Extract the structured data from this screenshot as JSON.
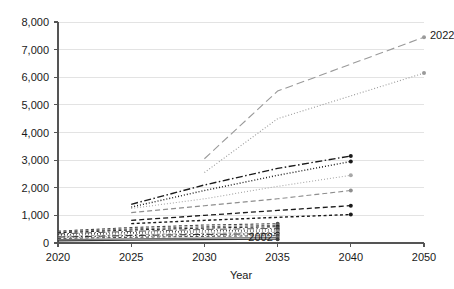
{
  "chart_data": {
    "type": "line",
    "title": "",
    "xlabel": "Year",
    "ylabel": "",
    "grid": true,
    "legend": "none",
    "x": [
      2020,
      2025,
      2030,
      2035,
      2040,
      2050
    ],
    "xtick_labels": [
      "2020",
      "2025",
      "2030",
      "2035",
      "2040",
      "2050"
    ],
    "ytick_labels": [
      "0",
      "1,000",
      "2,000",
      "3,000",
      "4,000",
      "5,000",
      "6,000",
      "7,000",
      "8,000"
    ],
    "ytick_values": [
      0,
      1000,
      2000,
      3000,
      4000,
      5000,
      6000,
      7000,
      8000
    ],
    "ylim": [
      0,
      8000
    ],
    "annotations": [
      {
        "text": "2022",
        "x": 2050,
        "y": 7450
      },
      {
        "text": "2002",
        "x": 2033,
        "y": 150
      }
    ],
    "series": [
      {
        "name": "s01",
        "style": "dash-long",
        "color": "#9a9a9a",
        "width": 1.1,
        "points": [
          {
            "x": 2030,
            "y": 3050
          },
          {
            "x": 2035,
            "y": 5500
          },
          {
            "x": 2050,
            "y": 7450
          }
        ]
      },
      {
        "name": "s02",
        "style": "dot",
        "color": "#9a9a9a",
        "width": 1.1,
        "points": [
          {
            "x": 2030,
            "y": 2550
          },
          {
            "x": 2035,
            "y": 4500
          },
          {
            "x": 2050,
            "y": 6150
          }
        ]
      },
      {
        "name": "s03",
        "style": "dash-dot",
        "color": "#1a1a1a",
        "width": 1.4,
        "points": [
          {
            "x": 2025,
            "y": 1400
          },
          {
            "x": 2030,
            "y": 2100
          },
          {
            "x": 2035,
            "y": 2700
          },
          {
            "x": 2040,
            "y": 3150
          }
        ]
      },
      {
        "name": "s04",
        "style": "dot",
        "color": "#1a1a1a",
        "width": 1.4,
        "points": [
          {
            "x": 2025,
            "y": 1300
          },
          {
            "x": 2030,
            "y": 1900
          },
          {
            "x": 2035,
            "y": 2450
          },
          {
            "x": 2040,
            "y": 2950
          }
        ]
      },
      {
        "name": "s05",
        "style": "dot",
        "color": "#a8a8a8",
        "width": 1.1,
        "points": [
          {
            "x": 2025,
            "y": 1250
          },
          {
            "x": 2030,
            "y": 1600
          },
          {
            "x": 2035,
            "y": 2050
          },
          {
            "x": 2040,
            "y": 2450
          }
        ]
      },
      {
        "name": "s06",
        "style": "dash-med",
        "color": "#8e8e8e",
        "width": 1.1,
        "points": [
          {
            "x": 2025,
            "y": 1100
          },
          {
            "x": 2030,
            "y": 1350
          },
          {
            "x": 2035,
            "y": 1600
          },
          {
            "x": 2040,
            "y": 1900
          }
        ]
      },
      {
        "name": "s07",
        "style": "dash-med",
        "color": "#1a1a1a",
        "width": 1.3,
        "points": [
          {
            "x": 2025,
            "y": 820
          },
          {
            "x": 2030,
            "y": 1000
          },
          {
            "x": 2035,
            "y": 1180
          },
          {
            "x": 2040,
            "y": 1350
          }
        ]
      },
      {
        "name": "s08",
        "style": "dash-short",
        "color": "#1a1a1a",
        "width": 1.4,
        "points": [
          {
            "x": 2025,
            "y": 700
          },
          {
            "x": 2030,
            "y": 820
          },
          {
            "x": 2035,
            "y": 930
          },
          {
            "x": 2040,
            "y": 1030
          }
        ]
      },
      {
        "name": "s09",
        "style": "dash-short",
        "color": "#4a4a4a",
        "width": 1.1,
        "points": [
          {
            "x": 2020,
            "y": 430
          },
          {
            "x": 2025,
            "y": 560
          },
          {
            "x": 2030,
            "y": 650
          },
          {
            "x": 2035,
            "y": 700
          }
        ]
      },
      {
        "name": "s10",
        "style": "dash-short",
        "color": "#6a6a6a",
        "width": 1.1,
        "points": [
          {
            "x": 2020,
            "y": 400
          },
          {
            "x": 2025,
            "y": 510
          },
          {
            "x": 2030,
            "y": 590
          },
          {
            "x": 2035,
            "y": 640
          }
        ]
      },
      {
        "name": "s11",
        "style": "dash-short",
        "color": "#2a2a2a",
        "width": 1.1,
        "points": [
          {
            "x": 2020,
            "y": 370
          },
          {
            "x": 2025,
            "y": 470
          },
          {
            "x": 2030,
            "y": 540
          },
          {
            "x": 2035,
            "y": 590
          }
        ]
      },
      {
        "name": "s12",
        "style": "dash-dot",
        "color": "#555555",
        "width": 1.0,
        "points": [
          {
            "x": 2020,
            "y": 330
          },
          {
            "x": 2025,
            "y": 420
          },
          {
            "x": 2030,
            "y": 490
          },
          {
            "x": 2035,
            "y": 530
          }
        ]
      },
      {
        "name": "s13",
        "style": "dot",
        "color": "#3a3a3a",
        "width": 1.0,
        "points": [
          {
            "x": 2020,
            "y": 300
          },
          {
            "x": 2025,
            "y": 380
          },
          {
            "x": 2030,
            "y": 440
          },
          {
            "x": 2035,
            "y": 480
          }
        ]
      },
      {
        "name": "s14",
        "style": "dot",
        "color": "#777777",
        "width": 1.0,
        "points": [
          {
            "x": 2020,
            "y": 270
          },
          {
            "x": 2025,
            "y": 340
          },
          {
            "x": 2030,
            "y": 395
          },
          {
            "x": 2035,
            "y": 430
          }
        ]
      },
      {
        "name": "s15",
        "style": "dash-short",
        "color": "#999999",
        "width": 1.0,
        "points": [
          {
            "x": 2020,
            "y": 240
          },
          {
            "x": 2025,
            "y": 300
          },
          {
            "x": 2030,
            "y": 350
          },
          {
            "x": 2035,
            "y": 385
          }
        ]
      },
      {
        "name": "s16",
        "style": "dash-dot",
        "color": "#222222",
        "width": 1.0,
        "points": [
          {
            "x": 2020,
            "y": 215
          },
          {
            "x": 2025,
            "y": 270
          },
          {
            "x": 2030,
            "y": 310
          },
          {
            "x": 2035,
            "y": 340
          }
        ]
      },
      {
        "name": "s17",
        "style": "dot",
        "color": "#8a8a8a",
        "width": 1.0,
        "points": [
          {
            "x": 2020,
            "y": 190
          },
          {
            "x": 2025,
            "y": 235
          },
          {
            "x": 2030,
            "y": 272
          },
          {
            "x": 2035,
            "y": 300
          }
        ]
      },
      {
        "name": "s18",
        "style": "dash-short",
        "color": "#444444",
        "width": 1.0,
        "points": [
          {
            "x": 2020,
            "y": 165
          },
          {
            "x": 2025,
            "y": 205
          },
          {
            "x": 2030,
            "y": 240
          },
          {
            "x": 2035,
            "y": 265
          }
        ]
      },
      {
        "name": "s19",
        "style": "solid",
        "color": "#6f6f6f",
        "width": 1.2,
        "points": [
          {
            "x": 2020,
            "y": 120
          },
          {
            "x": 2025,
            "y": 150
          },
          {
            "x": 2030,
            "y": 175
          },
          {
            "x": 2035,
            "y": 195
          }
        ]
      },
      {
        "name": "s20",
        "style": "solid",
        "color": "#3a3a3a",
        "width": 1.2,
        "points": [
          {
            "x": 2020,
            "y": 80
          },
          {
            "x": 2025,
            "y": 100
          },
          {
            "x": 2030,
            "y": 120
          },
          {
            "x": 2035,
            "y": 135
          }
        ]
      }
    ]
  }
}
